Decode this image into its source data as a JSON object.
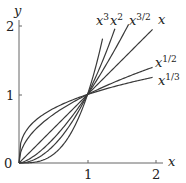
{
  "chart_data": {
    "type": "line",
    "title": "",
    "xlabel": "x",
    "ylabel": "y",
    "xlim": [
      0,
      2
    ],
    "ylim": [
      0,
      2
    ],
    "x_ticks": [
      "1",
      "2"
    ],
    "y_ticks": [
      "0",
      "1",
      "2"
    ],
    "grid": false,
    "legend": "inline labels at curve ends",
    "series": [
      {
        "name": "x^3",
        "label_base": "x",
        "label_exp": "3",
        "exponent": 3
      },
      {
        "name": "x^2",
        "label_base": "x",
        "label_exp": "2",
        "exponent": 2
      },
      {
        "name": "x^3/2",
        "label_base": "x",
        "label_exp": "3/2",
        "exponent": 1.5
      },
      {
        "name": "x",
        "label_base": "x",
        "label_exp": "",
        "exponent": 1
      },
      {
        "name": "x^1/2",
        "label_base": "x",
        "label_exp": "1/2",
        "exponent": 0.5
      },
      {
        "name": "x^1/3",
        "label_base": "x",
        "label_exp": "1/3",
        "exponent": 0.3333
      }
    ],
    "annotations": [
      "All curves pass through (0,0) and (1,1)"
    ]
  },
  "axes": {
    "x_label": "x",
    "y_label": "y",
    "origin_label": "0",
    "x_tick_1": "1",
    "x_tick_2": "2",
    "y_tick_1": "1",
    "y_tick_2": "2"
  },
  "labels": {
    "x3": {
      "base": "x",
      "exp": "3"
    },
    "x2": {
      "base": "x",
      "exp": "2"
    },
    "x32": {
      "base": "x",
      "exp": "3/2"
    },
    "x1": {
      "base": "x"
    },
    "x12": {
      "base": "x",
      "exp": "1/2"
    },
    "x13": {
      "base": "x",
      "exp": "1/3"
    }
  },
  "colors": {
    "curve": "#3a3a3a",
    "axis": "#555555"
  }
}
